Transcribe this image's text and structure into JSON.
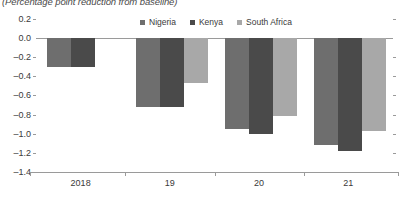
{
  "chart_data": {
    "type": "bar",
    "title": "(Percentage point reduction from baseline)",
    "xlabel": "",
    "ylabel": "",
    "categories": [
      "2018",
      "19",
      "20",
      "21"
    ],
    "series": [
      {
        "name": "Nigeria",
        "color": "#6e6e6e",
        "values": [
          -0.3,
          -0.72,
          -0.95,
          -1.12
        ]
      },
      {
        "name": "Kenya",
        "color": "#4a4a4a",
        "values": [
          -0.3,
          -0.72,
          -1.0,
          -1.18
        ]
      },
      {
        "name": "South Africa",
        "color": "#a8a8a8",
        "values": [
          null,
          -0.47,
          -0.82,
          -0.97
        ]
      }
    ],
    "ylim": [
      -1.4,
      0.2
    ],
    "ytick_labels": [
      "0.2",
      "0.0",
      "–0.2",
      "–0.4",
      "–0.6",
      "–0.8",
      "–1.0",
      "–1.2",
      "–1.4"
    ],
    "ytick_values": [
      0.2,
      0.0,
      -0.2,
      -0.4,
      -0.6,
      -0.8,
      -1.0,
      -1.2,
      -1.4
    ],
    "grid": false,
    "legend_position": "top-center"
  }
}
